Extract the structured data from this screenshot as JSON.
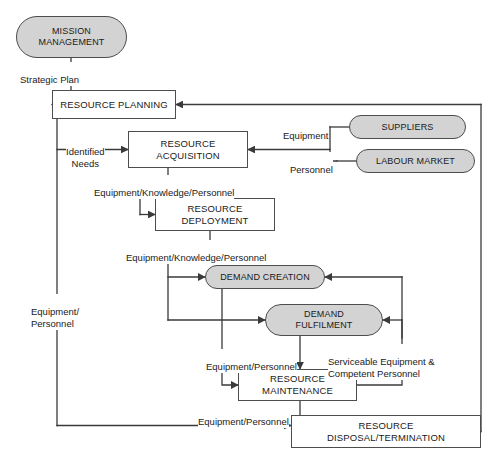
{
  "diagram": {
    "colors": {
      "oval_fill": "#d3d3d3",
      "box_fill": "#ffffff",
      "stroke": "#4d4d4d",
      "line": "#3a3a3a",
      "text": "#1a1a1a",
      "background": "#ffffff"
    },
    "nodes": [
      {
        "id": "mission-management",
        "label": "MISSION\nMANAGEMENT",
        "shape": "oval",
        "x": 16,
        "y": 16,
        "w": 111,
        "h": 42
      },
      {
        "id": "resource-planning",
        "label": "RESOURCE PLANNING",
        "shape": "box",
        "x": 52,
        "y": 90,
        "w": 124,
        "h": 29
      },
      {
        "id": "resource-acquisition",
        "label": "RESOURCE\nACQUISITION",
        "shape": "box",
        "x": 128,
        "y": 131,
        "w": 120,
        "h": 37
      },
      {
        "id": "suppliers",
        "label": "SUPPLIERS",
        "shape": "oval",
        "x": 349,
        "y": 115,
        "w": 117,
        "h": 24
      },
      {
        "id": "labour-market",
        "label": "LABOUR MARKET",
        "shape": "oval",
        "x": 356,
        "y": 149,
        "w": 119,
        "h": 24
      },
      {
        "id": "resource-deployment",
        "label": "RESOURCE\nDEPLOYMENT",
        "shape": "box",
        "x": 155,
        "y": 198,
        "w": 120,
        "h": 33
      },
      {
        "id": "demand-creation",
        "label": "DEMAND CREATION",
        "shape": "oval",
        "x": 205,
        "y": 265,
        "w": 120,
        "h": 24
      },
      {
        "id": "demand-fulfilment",
        "label": "DEMAND\nFULFILMENT",
        "shape": "oval",
        "x": 265,
        "y": 304,
        "w": 118,
        "h": 32
      },
      {
        "id": "resource-maintenance",
        "label": "RESOURCE\nMAINTENANCE",
        "shape": "box",
        "x": 238,
        "y": 369,
        "w": 119,
        "h": 32
      },
      {
        "id": "resource-disposal-termination",
        "label": "RESOURCE\nDISPOSAL/TERMINATION",
        "shape": "box",
        "x": 291,
        "y": 415,
        "w": 190,
        "h": 33
      }
    ],
    "edge_labels": [
      {
        "id": "strategic-plan",
        "text": "Strategic Plan",
        "x": 20,
        "y": 62,
        "align": "left"
      },
      {
        "id": "identified-needs",
        "text": "Identified\nNeeds",
        "x": 66,
        "y": 134,
        "align": "center"
      },
      {
        "id": "equipment-knowledge-personnel-1",
        "text": "Equipment/Knowledge/Personnel",
        "x": 94,
        "y": 175,
        "align": "left"
      },
      {
        "id": "equipment",
        "text": "Equipment",
        "x": 283,
        "y": 118,
        "align": "right"
      },
      {
        "id": "personnel",
        "text": "Personnel",
        "x": 290,
        "y": 152,
        "align": "right"
      },
      {
        "id": "equipment-knowledge-personnel-2",
        "text": "Equipment/Knowledge/Personnel",
        "x": 126,
        "y": 240,
        "align": "left"
      },
      {
        "id": "equipment-personnel-left",
        "text": "Equipment/\nPersonnel",
        "x": 31,
        "y": 294,
        "align": "left"
      },
      {
        "id": "equipment-personnel-mid",
        "text": "Equipment/Personnel",
        "x": 206,
        "y": 349,
        "align": "left"
      },
      {
        "id": "serviceable-equipment-competent-personnel",
        "text": "Serviceable Equipment &\nCompetent Personnel",
        "x": 328,
        "y": 344,
        "align": "left"
      },
      {
        "id": "equipment-personnel-bottom",
        "text": "Equipment/Personnel",
        "x": 198,
        "y": 404,
        "align": "left"
      }
    ]
  }
}
